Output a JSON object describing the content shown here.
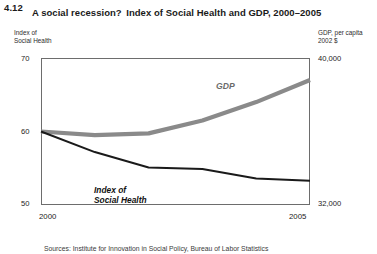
{
  "figure": {
    "number": "4.12",
    "title_line1": "A social recession?",
    "title_line2": "Index of Social Health and GDP, 2000–2005"
  },
  "axes": {
    "left_caption_line1": "Index of",
    "left_caption_line2": "Social Health",
    "right_caption_line1": "GDP, per capita",
    "right_caption_line2": "2002 $",
    "left_ticks": [
      "70",
      "60",
      "50"
    ],
    "right_ticks": [
      "40,000",
      "32,000"
    ],
    "x_ticks": [
      "2000",
      "2005"
    ]
  },
  "series_labels": {
    "gdp": "GDP",
    "ish_line1": "Index of",
    "ish_line2": "Social Health"
  },
  "source": {
    "note": "Sources: Institute for Innovation in Social Policy, Bureau of Labor Statistics"
  },
  "colors": {
    "gdp_line": "#8a8a8a",
    "ish_line": "#1a1a1a",
    "frame": "#6d6d6d",
    "background": "#ffffff"
  },
  "chart_data": {
    "type": "line",
    "title": "Index of Social Health and GDP, 2000–2005",
    "subtitle": "A social recession?",
    "xlabel": "",
    "ylabel": "Index of Social Health",
    "y2label": "GDP, per capita 2002 $",
    "xlim": [
      2000,
      2005
    ],
    "ylim": [
      50,
      70
    ],
    "y2lim": [
      32000,
      40000
    ],
    "grid": false,
    "legend": "inline-annotations",
    "x": [
      2000,
      2001,
      2002,
      2003,
      2004,
      2005
    ],
    "series": [
      {
        "name": "Index of Social Health",
        "axis": "left",
        "color": "#1a1a1a",
        "values": [
          60.0,
          57.2,
          55.1,
          54.9,
          53.6,
          53.3
        ]
      },
      {
        "name": "GDP, per capita 2002 $",
        "axis": "right",
        "color": "#8a8a8a",
        "values": [
          36000,
          35800,
          35900,
          36600,
          37600,
          38800
        ]
      }
    ]
  }
}
